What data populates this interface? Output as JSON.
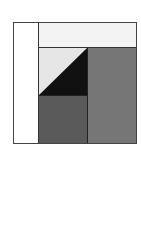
{
  "diagram": {
    "type": "quilt-block",
    "pieces": [
      {
        "id": "left-strip",
        "shape": "rectangle",
        "color": "#ffffff"
      },
      {
        "id": "top-strip",
        "shape": "rectangle",
        "color": "#f3f3f3"
      },
      {
        "id": "half-square-triangle",
        "shape": "square-split-diagonal",
        "upper_left_color": "#e6e6e6",
        "lower_right_color": "#111111"
      },
      {
        "id": "bottom-left-square",
        "shape": "square",
        "color": "#5a5a5a"
      },
      {
        "id": "right-rectangle",
        "shape": "rectangle",
        "color": "#767676"
      }
    ],
    "border_color": "#444444"
  }
}
